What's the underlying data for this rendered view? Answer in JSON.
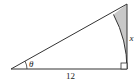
{
  "figure": {
    "type": "right-triangle",
    "labels": {
      "base": "12",
      "vertical_side": "x",
      "angle": "θ"
    },
    "colors": {
      "stroke": "#333333",
      "shaded_region": "#c8c8c8",
      "background": "#ffffff"
    },
    "elements": [
      "right triangle with horizontal base and vertical right side",
      "angle θ at left vertex",
      "right-angle marker at bottom-right vertex",
      "circular arc of radius 12 centered at left vertex",
      "shaded region between arc, hypotenuse and vertical side"
    ]
  }
}
